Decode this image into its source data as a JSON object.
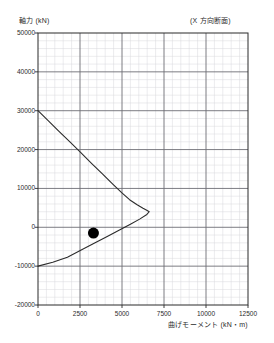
{
  "chart_data": {
    "type": "line",
    "title": "",
    "subtitle": "",
    "annotation": "(X 方向断面)",
    "ylabel": "軸力 (kN)",
    "xlabel": "曲げモーメント (kN・m)",
    "xlim": [
      0,
      12500
    ],
    "ylim": [
      -20000,
      50000
    ],
    "xticks": [
      0,
      2500,
      5000,
      7500,
      10000,
      12500
    ],
    "xtick_labels": [
      "0",
      "2500",
      "5000",
      "7500",
      "10000",
      "12500"
    ],
    "yticks": [
      50000,
      40000,
      30000,
      20000,
      10000,
      0,
      -10000,
      -20000
    ],
    "ytick_labels": [
      "50000",
      "40000",
      "30000",
      "20000",
      "10000",
      "0",
      "-10000",
      "-20000"
    ],
    "grid": true,
    "minor_grid": true,
    "minor_divisions": 5,
    "legend": "none",
    "series": [
      {
        "name": "interaction-curve",
        "type": "line",
        "color": "#2b2b2b",
        "points": [
          [
            0,
            30000
          ],
          [
            620,
            27400
          ],
          [
            1250,
            24700
          ],
          [
            1900,
            22000
          ],
          [
            2550,
            19200
          ],
          [
            3200,
            16400
          ],
          [
            3850,
            13700
          ],
          [
            4450,
            11100
          ],
          [
            4980,
            8900
          ],
          [
            5450,
            7100
          ],
          [
            5900,
            5800
          ],
          [
            6250,
            4900
          ],
          [
            6500,
            4300
          ],
          [
            6620,
            4000
          ],
          [
            6480,
            3300
          ],
          [
            6050,
            2100
          ],
          [
            5500,
            800
          ],
          [
            4850,
            -700
          ],
          [
            4150,
            -2300
          ],
          [
            3400,
            -4000
          ],
          [
            2600,
            -5800
          ],
          [
            1750,
            -7700
          ],
          [
            880,
            -9000
          ],
          [
            0,
            -10000
          ]
        ]
      },
      {
        "name": "design-point",
        "type": "scatter",
        "color": "#000000",
        "marker": "filled-circle",
        "marker_size": 11,
        "points": [
          [
            3300,
            -1500
          ]
        ]
      }
    ]
  },
  "axis_titles": {
    "y": "軸力 (kN)",
    "x": "曲げモーメント (kN・m)",
    "annotation": "(X 方向断面)"
  }
}
